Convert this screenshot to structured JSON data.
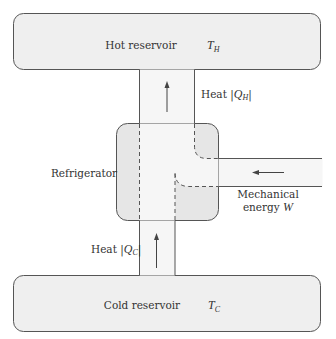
{
  "diagram": {
    "hot_reservoir": {
      "label": "Hot reservoir",
      "symbol": "T",
      "subscript": "H"
    },
    "cold_reservoir": {
      "label": "Cold reservoir",
      "symbol": "T",
      "subscript": "C"
    },
    "device": {
      "label": "Refrigerator"
    },
    "flows": {
      "heat_out": {
        "prefix": "Heat |",
        "symbol": "Q",
        "subscript": "H",
        "suffix": "|",
        "direction": "up"
      },
      "heat_in": {
        "prefix": "Heat |",
        "symbol": "Q",
        "subscript": "C",
        "suffix": "|",
        "direction": "up"
      },
      "work_in": {
        "line1": "Mechanical",
        "line2_prefix": "energy ",
        "symbol": "W",
        "direction": "left"
      }
    },
    "colors": {
      "reservoir_fill": "#efefef",
      "device_fill": "#e6e6e6",
      "channel_fill": "#f6f6f6",
      "stroke": "#555555",
      "text": "#333333"
    }
  }
}
